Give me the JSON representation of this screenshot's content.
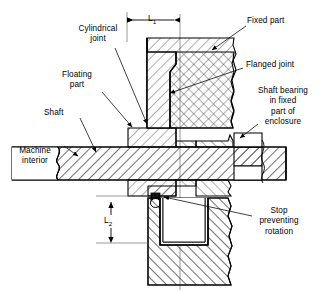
{
  "figure": {
    "type": "engineering-cross-section-diagram",
    "background_color": "#ffffff",
    "line_color": "#000000",
    "hatch_color": "#000000"
  },
  "dimensions": {
    "l1": {
      "symbol": "L",
      "subscript": "1",
      "orientation": "horizontal"
    },
    "l2": {
      "symbol": "L",
      "subscript": "2",
      "orientation": "vertical"
    }
  },
  "labels": {
    "cylindrical_joint": "Cylindrical\njoint",
    "floating_part": "Floating\npart",
    "shaft": "Shaft",
    "machine_interior": "Machine\ninterior",
    "fixed_part": "Fixed part",
    "flanged_joint": "Flanged joint",
    "shaft_bearing": "Shaft bearing\nin fixed\npart of\nenclosure",
    "stop_preventing_rotation": "Stop\npreventing\nrotation"
  },
  "parts": [
    {
      "name": "fixed-part-upper",
      "label_ref": "fixed_part"
    },
    {
      "name": "fixed-part-lower",
      "label_ref": "fixed_part"
    },
    {
      "name": "floating-part-upper",
      "label_ref": "floating_part"
    },
    {
      "name": "floating-part-lower",
      "label_ref": "floating_part"
    },
    {
      "name": "shaft",
      "label_ref": "shaft"
    },
    {
      "name": "shaft-bearing-block",
      "label_ref": "shaft_bearing"
    },
    {
      "name": "stop-pin",
      "label_ref": "stop_preventing_rotation"
    }
  ]
}
